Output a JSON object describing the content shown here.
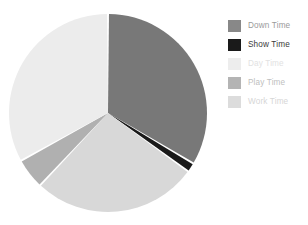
{
  "chart_data": {
    "type": "pie",
    "title": "",
    "legend_position": "right",
    "grid": false,
    "categories": [
      "Down Time",
      "Show Time",
      "Day Time",
      "Play Time",
      "Work Time"
    ],
    "values": [
      33.5,
      1.5,
      27.0,
      5.0,
      33.0
    ],
    "units": "percent",
    "slice_colors": [
      "#787878",
      "#1a1a1a",
      "#d8d8d8",
      "#b0b0b0",
      "#ececec"
    ],
    "start_angle_deg": 0,
    "direction": "clockwise",
    "separator_color": "#ffffff",
    "series": [
      {
        "name": "Time Breakdown",
        "values": [
          33.5,
          1.5,
          27.0,
          5.0,
          33.0
        ]
      }
    ]
  },
  "legend": {
    "items": [
      {
        "label": "Down Time",
        "swatch_color": "#888888",
        "text_color": "#9a9a9a"
      },
      {
        "label": "Show Time",
        "swatch_color": "#1a1a1a",
        "text_color": "#3a3a3a"
      },
      {
        "label": "Day Time",
        "swatch_color": "#ededed",
        "text_color": "#e2e2e2"
      },
      {
        "label": "Play Time",
        "swatch_color": "#b4b4b4",
        "text_color": "#c0c0c0"
      },
      {
        "label": "Work Time",
        "swatch_color": "#dcdcdc",
        "text_color": "#d6d6d6"
      }
    ]
  },
  "canvas": {
    "background": "#ffffff",
    "center_x": 108,
    "center_y": 113,
    "radius": 99
  }
}
